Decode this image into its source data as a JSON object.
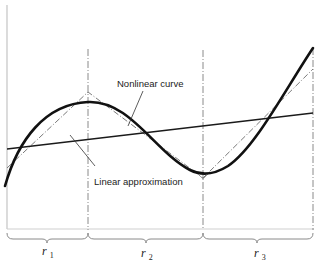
{
  "figure": {
    "type": "diagram",
    "labels": {
      "nonlinear_curve": "Nonlinear curve",
      "linear_approximation": "Linear approximation"
    },
    "regions": [
      {
        "id": "r1",
        "symbol": "r",
        "subscript": "1"
      },
      {
        "id": "r2",
        "symbol": "r",
        "subscript": "2"
      },
      {
        "id": "r3",
        "symbol": "r",
        "subscript": "3"
      }
    ],
    "colors": {
      "curve": "#111111",
      "linear_line": "#1a1a1a",
      "piecewise_dashed": "#777777",
      "dividers": "#888888",
      "frame": "#bbbbbb",
      "background": "#ffffff"
    }
  }
}
